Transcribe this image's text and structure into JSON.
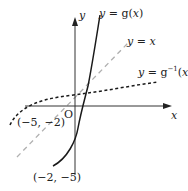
{
  "diagram": {
    "type": "function-inverse-graph",
    "axes": {
      "x_label": "x",
      "y_label": "y",
      "origin_label": "O"
    },
    "curves": [
      {
        "name": "g",
        "label_prefix": "y = g(",
        "label_var": "x",
        "label_suffix": ")",
        "style": "solid"
      },
      {
        "name": "identity",
        "label_prefix": "y = ",
        "label_var": "x",
        "style": "dashed-gray"
      },
      {
        "name": "g-inverse",
        "label_prefix": "y = g",
        "label_sup": "−1",
        "label_open": "(",
        "label_var": "x",
        "label_suffix": ")",
        "style": "dotted"
      }
    ],
    "points": [
      {
        "label": "(−5, −2)",
        "curve": "g-inverse"
      },
      {
        "label": "(−2, −5)",
        "curve": "g"
      }
    ],
    "colors": {
      "axis": "#333333",
      "curve": "#1a1a1a",
      "identity_line": "#b0b0b0"
    }
  }
}
